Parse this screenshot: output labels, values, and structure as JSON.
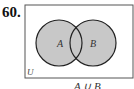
{
  "problem": {
    "number": "60."
  },
  "diagram": {
    "type": "venn",
    "universe_label": "U",
    "sets": [
      {
        "label": "A",
        "shaded": true
      },
      {
        "label": "B",
        "shaded": true
      }
    ],
    "shaded_region": "A ∪ B",
    "colors": {
      "shade": "#c8c8c8",
      "stroke": "#222222",
      "frame": "#555555"
    }
  },
  "caption": "A ∪ B"
}
